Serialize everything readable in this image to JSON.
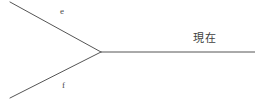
{
  "figure": {
    "background_color": "#ffffff",
    "line_color": "#555555",
    "line_width": 1
  },
  "labels": {
    "branch_upper": "e",
    "branch_lower": "f",
    "present": "現在",
    "caption_partial": "        "
  },
  "geometry": {
    "vertex": {
      "x": 101,
      "y": 52
    },
    "upper_branch_start": {
      "x": 10,
      "y": 2
    },
    "lower_branch_start": {
      "x": 10,
      "y": 98
    },
    "trunk_end": {
      "x": 255,
      "y": 52
    }
  },
  "colors": {
    "line": "#555555",
    "label_latin": "#4a4a4a",
    "label_cjk": "#3f3f3f",
    "background": "#ffffff"
  },
  "chart_data": {
    "type": "line",
    "title": "",
    "xlabel": "",
    "ylabel": "",
    "grid": false,
    "legend": "none",
    "xlim": [
      0,
      255
    ],
    "ylim": [
      109,
      0
    ],
    "series": [
      {
        "name": "e",
        "points": [
          [
            10,
            2
          ],
          [
            101,
            52
          ]
        ]
      },
      {
        "name": "f",
        "points": [
          [
            10,
            98
          ],
          [
            101,
            52
          ]
        ]
      },
      {
        "name": "現在",
        "points": [
          [
            101,
            52
          ],
          [
            255,
            52
          ]
        ]
      }
    ],
    "annotations": [
      {
        "text": "e",
        "x": 60,
        "y": 12
      },
      {
        "text": "f",
        "x": 62,
        "y": 86
      },
      {
        "text": "現在",
        "x": 193,
        "y": 39
      }
    ]
  }
}
